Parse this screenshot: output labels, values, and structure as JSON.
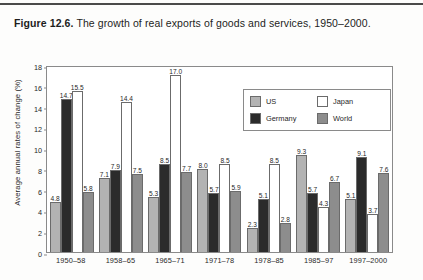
{
  "figure": {
    "label": "Figure 12.6.",
    "caption": " The growth of real exports of goods and services, 1950–2000."
  },
  "chart_data": {
    "type": "bar",
    "title": "The growth of real exports of goods and services, 1950–2000.",
    "xlabel": "",
    "ylabel": "Average annual rates of change (%)",
    "ylim": [
      0,
      18
    ],
    "yticks": [
      0,
      2,
      4,
      6,
      8,
      10,
      12,
      14,
      16,
      18
    ],
    "grid": false,
    "legend_position": "top-right-inside",
    "categories": [
      "1950–58",
      "1958–65",
      "1965–71",
      "1971–78",
      "1978–85",
      "1985–97",
      "1997–2000"
    ],
    "series": [
      {
        "name": "US",
        "color": "#b3b3b3",
        "values": [
          4.8,
          7.1,
          5.3,
          8.0,
          2.3,
          9.3,
          5.1
        ]
      },
      {
        "name": "Germany",
        "color": "#2b2b2b",
        "values": [
          14.7,
          7.9,
          8.5,
          5.7,
          5.1,
          5.7,
          9.1
        ]
      },
      {
        "name": "Japan",
        "color": "#ffffff",
        "values": [
          15.5,
          14.4,
          17.0,
          8.5,
          8.5,
          4.3,
          3.7
        ]
      },
      {
        "name": "World",
        "color": "#8d8d8d",
        "values": [
          5.8,
          7.5,
          7.7,
          5.9,
          2.8,
          6.7,
          7.6
        ]
      }
    ]
  }
}
